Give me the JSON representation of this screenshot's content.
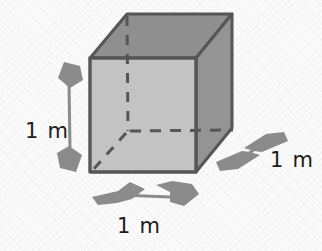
{
  "figure": {
    "type": "geometry-diagram",
    "shape": "cube",
    "canvas": {
      "width": 322,
      "height": 251
    },
    "background_color": "#fbfbfb"
  },
  "colors": {
    "front_face": "#c3c3c3",
    "top_face": "#8f8f8f",
    "right_face": "#949494",
    "edge_stroke": "#565656",
    "hidden_edge_stroke": "#565656",
    "arrow_fill": "#8b8b8b",
    "arrow_line": "#8b8b8b",
    "label_text": "#1c1c1c"
  },
  "cube": {
    "name": "cube",
    "front_face_name": "front-face",
    "top_face_name": "top-face",
    "right_face_name": "right-face",
    "hidden_edges_name": "hidden-edges-dashed"
  },
  "dimensions": [
    {
      "id": "height",
      "label": "1 m",
      "value": 1,
      "unit": "m",
      "orientation": "vertical",
      "position": "left",
      "arrow": "double-headed"
    },
    {
      "id": "width",
      "label": "1 m",
      "value": 1,
      "unit": "m",
      "orientation": "horizontal",
      "position": "bottom",
      "arrow": "double-headed"
    },
    {
      "id": "depth",
      "label": "1 m",
      "value": 1,
      "unit": "m",
      "orientation": "diagonal",
      "position": "right",
      "arrow": "double-headed"
    }
  ]
}
